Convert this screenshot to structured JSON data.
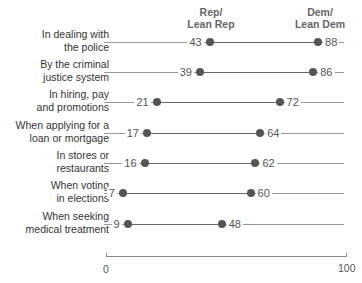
{
  "chart_data": {
    "type": "dot-plot",
    "title": "",
    "xlabel": "",
    "ylabel": "",
    "xlim": [
      0,
      100
    ],
    "xticks": [
      "0",
      "100"
    ],
    "series": [
      {
        "name": "Rep/ Lean Rep",
        "header_line1": "Rep/",
        "header_line2": "Lean Rep",
        "color": "#555555"
      },
      {
        "name": "Dem/ Lean Dem",
        "header_line1": "Dem/",
        "header_line2": "Lean Dem",
        "color": "#555555"
      }
    ],
    "categories": [
      {
        "line1": "In dealing with",
        "line2": "the police",
        "rep": 43,
        "dem": 88
      },
      {
        "line1": "By the criminal",
        "line2": "justice system",
        "rep": 39,
        "dem": 86
      },
      {
        "line1": "In hiring, pay",
        "line2": "and promotions",
        "rep": 21,
        "dem": 72
      },
      {
        "line1": "When applying for a",
        "line2": "loan or mortgage",
        "rep": 17,
        "dem": 64
      },
      {
        "line1": "In stores or",
        "line2": "restaurants",
        "rep": 16,
        "dem": 62
      },
      {
        "line1": "When voting",
        "line2": "in elections",
        "rep": 7,
        "dem": 60
      },
      {
        "line1": "When seeking",
        "line2": "medical treatment",
        "rep": 9,
        "dem": 48
      }
    ]
  }
}
